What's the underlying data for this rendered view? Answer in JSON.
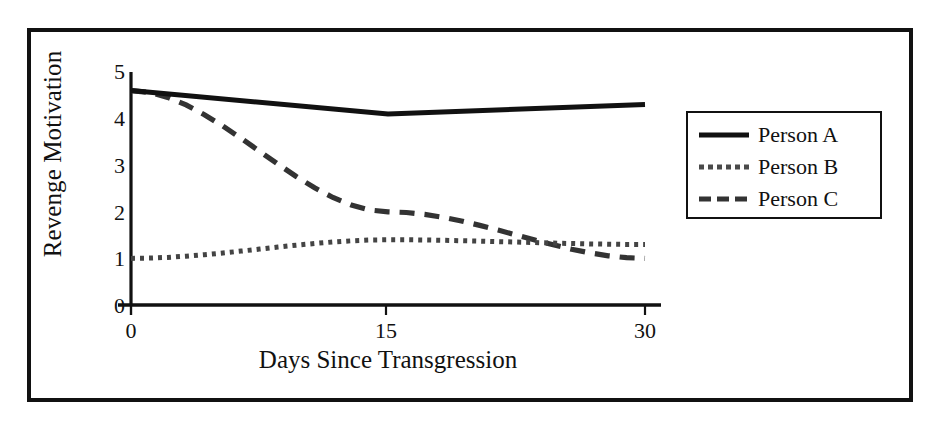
{
  "chart_data": {
    "type": "line",
    "title": "",
    "xlabel": "Days Since Transgression",
    "ylabel": "Revenge Motivation",
    "x": [
      0,
      15,
      30
    ],
    "xlim": [
      0,
      30
    ],
    "ylim": [
      0,
      5
    ],
    "xticks": [
      "0",
      "15",
      "30"
    ],
    "yticks": [
      "0",
      "1",
      "2",
      "3",
      "4",
      "5"
    ],
    "grid": false,
    "legend_position": "right",
    "series": [
      {
        "name": "Person A",
        "values": [
          4.6,
          4.1,
          4.3
        ],
        "style": "solid",
        "color": "#111111"
      },
      {
        "name": "Person B",
        "values": [
          1.0,
          1.4,
          1.3
        ],
        "style": "dotted",
        "color": "#444444"
      },
      {
        "name": "Person C",
        "values": [
          4.6,
          2.0,
          1.0
        ],
        "style": "dashed",
        "color": "#333333"
      }
    ]
  },
  "axes": {
    "y_title": "Revenge Motivation",
    "x_title": "Days Since Transgression",
    "y_tick_0": "0",
    "y_tick_1": "1",
    "y_tick_2": "2",
    "y_tick_3": "3",
    "y_tick_4": "4",
    "y_tick_5": "5",
    "x_tick_0": "0",
    "x_tick_1": "15",
    "x_tick_2": "30"
  },
  "legend": {
    "items": [
      {
        "label": "Person A",
        "style": "solid"
      },
      {
        "label": "Person B",
        "style": "dotted"
      },
      {
        "label": "Person C",
        "style": "dashed"
      }
    ]
  },
  "colors": {
    "frame": "#111111",
    "axis": "#111111",
    "background": "#ffffff",
    "series_a": "#111111",
    "series_b": "#444444",
    "series_c": "#333333"
  }
}
